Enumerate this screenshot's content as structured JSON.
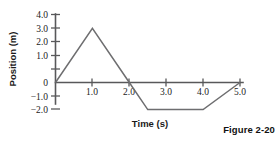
{
  "caption": "Figure 2-20",
  "chart_data": {
    "type": "line",
    "title": "",
    "xlabel": "Time (s)",
    "ylabel": "Position (m)",
    "xlim": [
      0,
      5.2
    ],
    "ylim": [
      -2.4,
      4.2
    ],
    "grid": false,
    "legend": false,
    "xticks": [
      1.0,
      2.0,
      3.0,
      4.0,
      5.0
    ],
    "xtick_labels": [
      "1.0",
      "2.0",
      "3.0",
      "4.0",
      "5.0"
    ],
    "yticks": [
      4.0,
      3.0,
      2.0,
      1.0,
      0,
      -1.0,
      -2.0
    ],
    "ytick_labels": [
      "4.0",
      "3.0",
      "2.0",
      "1.0",
      "0",
      "−1.0",
      "−2.0"
    ],
    "series": [
      {
        "name": "position",
        "x": [
          0.0,
          1.0,
          2.0,
          2.5,
          4.0,
          5.0
        ],
        "y": [
          0.0,
          4.0,
          0.0,
          -2.0,
          -2.0,
          0.0
        ]
      }
    ],
    "line_color": "#6e6e70",
    "axis_color": "#58585a"
  }
}
